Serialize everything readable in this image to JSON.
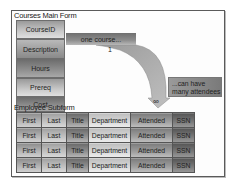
{
  "main_form": {
    "title": "Courses Main Form",
    "fields": [
      "CourseID",
      "Description",
      "Hours",
      "Prereq",
      "Cost"
    ]
  },
  "relationship": {
    "one_side_label": "one course...",
    "one_side_cardinality": "1",
    "many_side_label_line1": "...can have",
    "many_side_label_line2": "many attendees",
    "many_side_cardinality": "∞"
  },
  "subform": {
    "title": "Employee Subform",
    "columns": [
      "First",
      "Last",
      "Title",
      "Department",
      "Attended",
      "SSN"
    ],
    "rows": [
      [
        "First",
        "Last",
        "Title",
        "Department",
        "Attended",
        "SSN"
      ],
      [
        "First",
        "Last",
        "Title",
        "Department",
        "Attended",
        "SSN"
      ],
      [
        "First",
        "Last",
        "Title",
        "Department",
        "Attended",
        "SSN"
      ],
      [
        "First",
        "Last",
        "Title",
        "Department",
        "Attended",
        "SSN"
      ]
    ]
  }
}
